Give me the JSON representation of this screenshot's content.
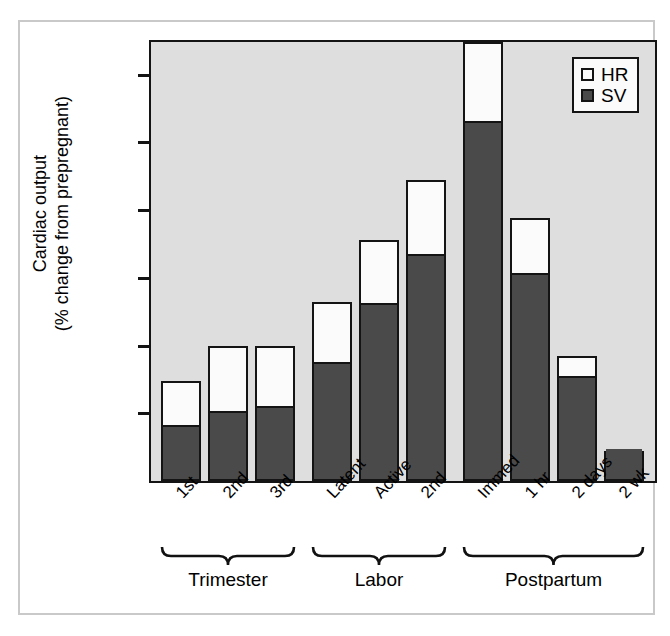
{
  "chart_data": {
    "type": "bar",
    "stacked": true,
    "title": "",
    "xlabel": "",
    "ylabel": "Cardiac output (% change from prepregnant)",
    "ylabel_lines": [
      "Cardiac output",
      "(% change from prepregnant)"
    ],
    "ylim": [
      0,
      162
    ],
    "yticks": [
      0,
      25,
      50,
      75,
      100,
      125,
      150
    ],
    "ytick_labels": [
      "0",
      "25",
      "50",
      "75",
      "100",
      "125",
      "150"
    ],
    "grid": false,
    "legend_position": "top-right",
    "categories": [
      "1st",
      "2nd",
      "3rd",
      "Latent",
      "Active",
      "2nd",
      "Immed",
      "1 hr",
      "2 days",
      "2 wk"
    ],
    "groups": [
      {
        "label": "Trimester",
        "categories": [
          "1st",
          "2nd",
          "3rd"
        ]
      },
      {
        "label": "Labor",
        "categories": [
          "Latent",
          "Active",
          "2nd"
        ]
      },
      {
        "label": "Postpartum",
        "categories": [
          "Immed",
          "1 hr",
          "2 days",
          "2 wk"
        ]
      }
    ],
    "series": [
      {
        "name": "SV",
        "color": "#4a4a4a",
        "values": [
          20,
          25,
          27,
          43,
          65,
          83,
          132,
          76,
          38,
          11
        ]
      },
      {
        "name": "HR",
        "color": "#fbfbfb",
        "values": [
          17,
          25,
          23,
          23,
          24,
          28,
          30,
          21,
          8,
          0
        ]
      }
    ],
    "totals": [
      37,
      50,
      50,
      66,
      89,
      111,
      162,
      97,
      46,
      11
    ],
    "legend": [
      {
        "label": "HR",
        "swatch": "#fbfbfb"
      },
      {
        "label": "SV",
        "swatch": "#4a4a4a"
      }
    ],
    "colors": {
      "plot_background": "#dedede",
      "axis": "#141414",
      "frame": "#c9c9c9",
      "page_background": "#ffffff",
      "sv": "#4a4a4a",
      "hr": "#fbfbfb"
    }
  }
}
